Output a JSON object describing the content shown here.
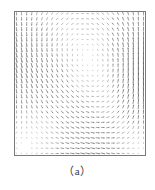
{
  "figure": {
    "caption": "（a）",
    "frame_color": "#7a7a7a",
    "background_color": "#ffffff",
    "arrow_color": "#5a5a5a"
  },
  "chart_data": {
    "type": "scatter",
    "title": "",
    "subtitle": "",
    "xlabel": "",
    "ylabel": "",
    "xlim": [
      0,
      1
    ],
    "ylim": [
      0,
      1
    ],
    "grid": false,
    "legend": null,
    "annotations": [],
    "tick_labels_x": [],
    "tick_labels_y": [],
    "plot_kind": "vector-field-quiver",
    "grid_nx": 26,
    "grid_ny": 28,
    "vortex_centers": [
      {
        "name": "primary-vortex",
        "x": 0.34,
        "y": 0.38,
        "circulation": -1.0,
        "core_radius": 0.12
      }
    ],
    "secondary_features": [
      {
        "name": "upper-right-shear",
        "x": 0.85,
        "y": 0.88,
        "direction": "horizontal"
      },
      {
        "name": "lower-left-corner",
        "x": 0.06,
        "y": 0.08,
        "direction": "weak"
      }
    ],
    "arrow_scale": 4.6,
    "max_arrow_length_px": 5.2,
    "series": [
      {
        "name": "velocity-field",
        "values": []
      }
    ]
  }
}
